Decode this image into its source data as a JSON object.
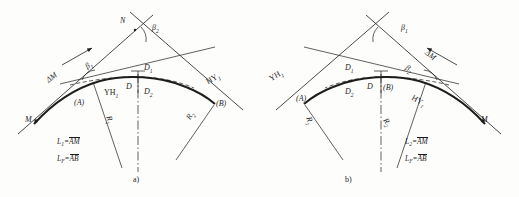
{
  "figure": {
    "ink_color": "#1d1d1d",
    "paper_color": "#fdfdfc"
  },
  "panels": [
    {
      "id": "a",
      "caption": "a)",
      "orientation": "left-to-right",
      "labels": {
        "apex_point": "N",
        "beta_top": "β",
        "beta_top_sub": "2",
        "beta_tangent": "β",
        "beta_tangent_sub": "1",
        "delta_m": "ΔM",
        "start_point": "M",
        "yh_point": "YH",
        "yh_sub": "1",
        "hy_point": "HY",
        "hy_sub": "1",
        "bracket_a": "(A)",
        "bracket_b": "(B)",
        "offset_d1": "D",
        "offset_d1_sub": "1",
        "offset_d": "D",
        "offset_d2": "D",
        "offset_d2_sub": "2",
        "radius_left": "R",
        "radius_left_sub": "1",
        "radius_right": "R",
        "radius_right_sub": "2"
      },
      "formulas": [
        {
          "lhs": "L",
          "lhs_sub": "1",
          "eq": "=",
          "arc": "AM"
        },
        {
          "lhs": "L",
          "lhs_sub": "F",
          "eq": "=",
          "arc": "AB"
        }
      ]
    },
    {
      "id": "b",
      "caption": "b)",
      "orientation": "right-to-left",
      "labels": {
        "beta_top": "β",
        "beta_top_sub": "1",
        "beta_tangent": "β",
        "beta_tangent_sub": "2",
        "delta_m": "ΔM",
        "start_point": "M",
        "yh_point": "YH",
        "yh_sub": "1",
        "hy_point": "HY",
        "hy_sub": "1",
        "bracket_a": "(A)",
        "bracket_b": "(B)",
        "offset_d1": "D",
        "offset_d1_sub": "1",
        "offset_d": "D",
        "offset_d2": "D",
        "offset_d2_sub": "2",
        "radius_left": "R",
        "radius_left_sub": "1",
        "radius_right": "R",
        "radius_right_sub": "2"
      },
      "formulas": [
        {
          "lhs": "L",
          "lhs_sub": "2",
          "eq": "=",
          "arc": "AM"
        },
        {
          "lhs": "L",
          "lhs_sub": "F",
          "eq": "=",
          "arc": "AB"
        }
      ]
    }
  ]
}
